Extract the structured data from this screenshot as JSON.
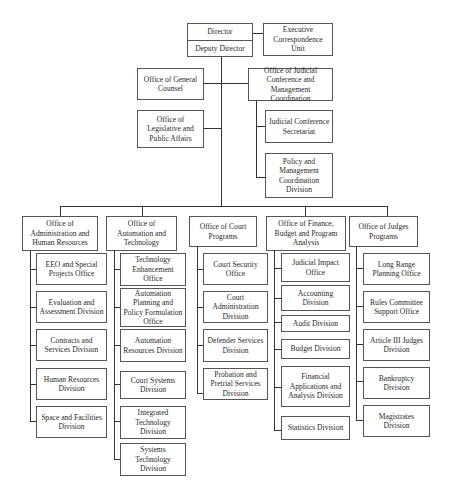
{
  "top": {
    "director": "Director",
    "deputy_director": "Deputy Director",
    "executive_unit": "Executive Correspondence Unit"
  },
  "staff": {
    "general_counsel": "Office of General Counsel",
    "legislative": "Office of Legislative and Public Affairs",
    "judicial_conference": "Office of Judicial Conference and Management Coordination",
    "jc_children": [
      "Judicial Conference Secretariat",
      "Policy and Management Coordination Division"
    ]
  },
  "offices": [
    {
      "title": "Office of Administration and Human Resources",
      "children": [
        "EEO and Special Projects Office",
        "Evaluation and Assessment Division",
        "Contracts and Services Division",
        "Human Resources Division",
        "Space and Facilities Division"
      ]
    },
    {
      "title": "Office of Automation and Technology",
      "children": [
        "Technology Enhancement Office",
        "Automation Planning and Policy Formulation Office",
        "Automation Resources Division",
        "Court Systems Division",
        "Integrated Technology Division",
        "Systems Technology Division"
      ]
    },
    {
      "title": "Office of Court Programs",
      "children": [
        "Court Security Office",
        "Court Administration Division",
        "Defender Services Division",
        "Probation and Pretrial Services Division"
      ]
    },
    {
      "title": "Office of Finance, Budget and Program Analysis",
      "children": [
        "Judicial Impact Office",
        "Accounting Division",
        "Audit Division",
        "Budget Division",
        "Financial Applications and Analysis Division",
        "Statistics Division"
      ]
    },
    {
      "title": "Office of Judges Programs",
      "children": [
        "Long Range Planning Office",
        "Rules Committee Support Office",
        "Article III Judges Division",
        "Bankruptcy Division",
        "Magistrates Division"
      ]
    }
  ]
}
